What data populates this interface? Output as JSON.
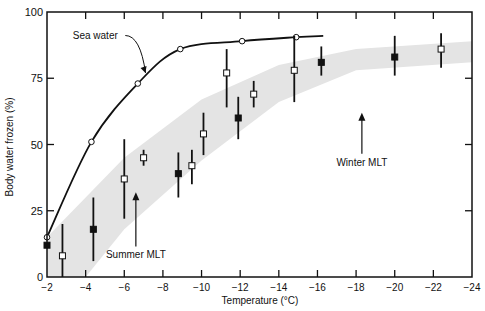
{
  "chart_data": {
    "type": "scatter",
    "title": "",
    "xlabel": "Temperature (°C)",
    "ylabel": "Body water frozen (%)",
    "xlim": [
      -2,
      -24
    ],
    "ylim": [
      0,
      100
    ],
    "x_ticks": [
      -2,
      -4,
      -6,
      -8,
      -10,
      -12,
      -14,
      -16,
      -18,
      -20,
      -22,
      -24
    ],
    "x_tick_labels": [
      "-2",
      "-4",
      "-6",
      "-8",
      "-10",
      "-12",
      "-14",
      "-16",
      "-18",
      "-20",
      "-22",
      "-24"
    ],
    "y_ticks": [
      0,
      25,
      50,
      75,
      100
    ],
    "y_tick_labels": [
      "0",
      "25",
      "50",
      "75",
      "100"
    ],
    "grid": false,
    "series": [
      {
        "name": "Sea water",
        "style": "line with open circles",
        "x": [
          -2,
          -4.3,
          -6.7,
          -8.9,
          -12.1,
          -14.9,
          -16.3
        ],
        "y": [
          15,
          51,
          73,
          86,
          89,
          90.5,
          91
        ]
      },
      {
        "name": "Open squares (mean ± range)",
        "style": "open square with error bar",
        "points": [
          {
            "x": -2.8,
            "y": 8,
            "low": 0,
            "high": 20
          },
          {
            "x": -6.0,
            "y": 37,
            "low": 22,
            "high": 52
          },
          {
            "x": -7.0,
            "y": 45,
            "low": 42,
            "high": 48
          },
          {
            "x": -9.5,
            "y": 42,
            "low": 35,
            "high": 48
          },
          {
            "x": -10.1,
            "y": 54,
            "low": 46,
            "high": 62
          },
          {
            "x": -11.3,
            "y": 77,
            "low": 64,
            "high": 86
          },
          {
            "x": -12.7,
            "y": 69,
            "low": 64,
            "high": 74
          },
          {
            "x": -14.8,
            "y": 78,
            "low": 66,
            "high": 91
          },
          {
            "x": -22.4,
            "y": 86,
            "low": 79,
            "high": 92
          }
        ]
      },
      {
        "name": "Filled squares (mean ± range)",
        "style": "filled square with error bar",
        "points": [
          {
            "x": -2.0,
            "y": 12,
            "low": 12,
            "high": 12
          },
          {
            "x": -4.4,
            "y": 18,
            "low": 6,
            "high": 30
          },
          {
            "x": -8.8,
            "y": 39,
            "low": 30,
            "high": 47
          },
          {
            "x": -11.9,
            "y": 60,
            "low": 52,
            "high": 68
          },
          {
            "x": -16.2,
            "y": 81,
            "low": 76,
            "high": 87
          },
          {
            "x": -20.0,
            "y": 83,
            "low": 76,
            "high": 91
          }
        ]
      }
    ],
    "shaded_band": {
      "description": "Gray band of expected body water frozen",
      "upper": [
        [
          -2,
          15
        ],
        [
          -6,
          45
        ],
        [
          -10,
          67
        ],
        [
          -14,
          80
        ],
        [
          -18,
          86
        ],
        [
          -24,
          89
        ]
      ],
      "lower": [
        [
          -2,
          0
        ],
        [
          -4,
          0
        ],
        [
          -6,
          18
        ],
        [
          -10,
          44
        ],
        [
          -14,
          66
        ],
        [
          -18,
          78
        ],
        [
          -24,
          81
        ]
      ]
    },
    "annotations": [
      {
        "text": "Sea water",
        "x": -4.5,
        "y": 90,
        "arrow_to": [
          -7.1,
          77
        ]
      },
      {
        "text": "Summer MLT",
        "x": -6.6,
        "y": 7,
        "arrow_to": [
          -6.6,
          32
        ]
      },
      {
        "text": "Winter MLT",
        "x": -18.3,
        "y": 42,
        "arrow_to": [
          -18.3,
          62
        ]
      }
    ]
  }
}
